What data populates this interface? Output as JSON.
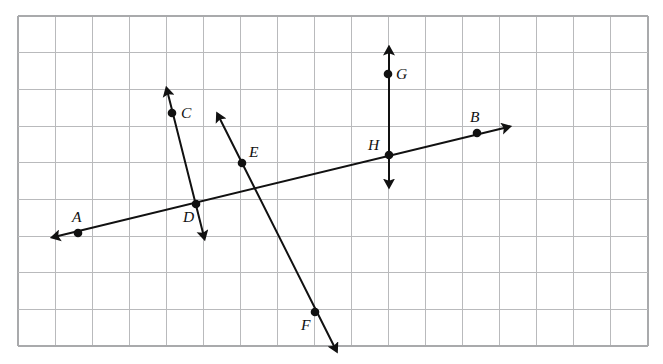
{
  "figure": {
    "type": "geometry-diagram",
    "canvas": {
      "width": 663,
      "height": 364
    },
    "background_color": "#ffffff",
    "line_color": "#111111",
    "grid_color": "#b9babc",
    "grid": {
      "x_start": 18,
      "y_start": 16,
      "x_end": 648,
      "y_end": 346,
      "cols": 17,
      "rows": 9,
      "cell_width": 37.06,
      "cell_height": 36.67,
      "visible": true
    },
    "points": [
      {
        "id": "A",
        "label": "A",
        "x": 78,
        "y": 233,
        "label_x": 72,
        "label_y": 222
      },
      {
        "id": "B",
        "label": "B",
        "x": 477,
        "y": 133,
        "label_x": 470,
        "label_y": 122
      },
      {
        "id": "C",
        "label": "C",
        "x": 172,
        "y": 113,
        "label_x": 181,
        "label_y": 118
      },
      {
        "id": "D",
        "label": "D",
        "x": 196,
        "y": 204,
        "label_x": 183,
        "label_y": 222
      },
      {
        "id": "E",
        "label": "E",
        "x": 242,
        "y": 163,
        "label_x": 249,
        "label_y": 157
      },
      {
        "id": "F",
        "label": "F",
        "x": 315,
        "y": 312,
        "label_x": 301,
        "label_y": 330
      },
      {
        "id": "G",
        "label": "G",
        "x": 388,
        "y": 74,
        "label_x": 396,
        "label_y": 79
      },
      {
        "id": "H",
        "label": "H",
        "x": 389,
        "y": 155,
        "label_x": 368,
        "label_y": 150
      }
    ],
    "lines": [
      {
        "id": "AB",
        "name": "line-ab",
        "through": [
          "A",
          "D",
          "H",
          "B"
        ],
        "x1": 58,
        "y1": 236,
        "x2": 504,
        "y2": 128,
        "arrow_start": true,
        "arrow_end": true
      },
      {
        "id": "CD",
        "name": "line-cd",
        "through": [
          "C",
          "D"
        ],
        "x1": 168,
        "y1": 94,
        "x2": 203,
        "y2": 233,
        "arrow_start": true,
        "arrow_end": true
      },
      {
        "id": "EF",
        "name": "line-ef",
        "through": [
          "E",
          "F"
        ],
        "x1": 220,
        "y1": 119,
        "x2": 334,
        "y2": 346,
        "arrow_start": true,
        "arrow_end": true
      },
      {
        "id": "GH",
        "name": "line-gh",
        "through": [
          "G",
          "H"
        ],
        "x1": 389,
        "y1": 53,
        "x2": 389,
        "y2": 181,
        "arrow_start": true,
        "arrow_end": true
      }
    ]
  }
}
